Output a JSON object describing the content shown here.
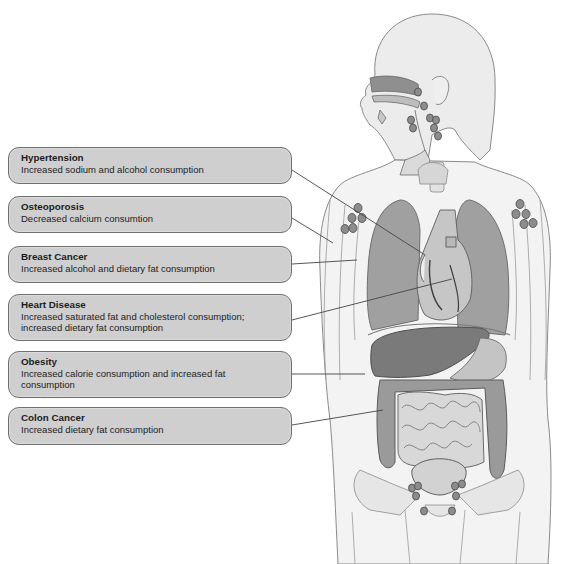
{
  "figure": {
    "colors": {
      "box_fill": "#cfcfcf",
      "box_border": "#6f6f6f",
      "organ_dark": "#7a7a7a",
      "organ_mid": "#a6a6a6",
      "organ_light": "#d4d4d4",
      "body_fill": "#f2f2f2",
      "outline": "#8a8a8a",
      "lymph_node": "#8c8c8c"
    }
  },
  "labels": [
    {
      "title": "Hypertension",
      "description": "Increased sodium and alcohol consumption",
      "target": "heart/vessels"
    },
    {
      "title": "Osteoporosis",
      "description": "Decreased calcium consumtion",
      "target": "arm bone"
    },
    {
      "title": "Breast Cancer",
      "description": "Increased alcohol and dietary fat consumption",
      "target": "breast"
    },
    {
      "title": "Heart Disease",
      "description": "Increased saturated fat and cholesterol consumption; increased dietary fat consumption",
      "target": "heart"
    },
    {
      "title": "Obesity",
      "description": "Increased calorie consumption and increased fat consumption",
      "target": "abdomen"
    },
    {
      "title": "Colon Cancer",
      "description": "Increased dietary fat consumption",
      "target": "colon"
    }
  ]
}
